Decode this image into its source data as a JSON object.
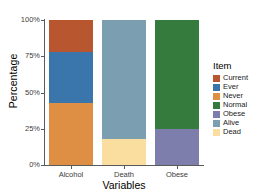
{
  "chart_data": {
    "type": "bar",
    "subtype": "stacked-percent",
    "title": "",
    "xlabel": "Variables",
    "ylabel": "Percentage",
    "categories": [
      "Alcohol",
      "Death",
      "Obese"
    ],
    "ylim": [
      0,
      100
    ],
    "ytick_labels": [
      "0%",
      "25%",
      "50%",
      "75%",
      "100%"
    ],
    "ytick_values": [
      0,
      25,
      50,
      75,
      100
    ],
    "grid": false,
    "legend_title": "Item",
    "legend_position": "right",
    "series": [
      {
        "name": "Current",
        "color": "#b8562f",
        "values": [
          22,
          0,
          0
        ]
      },
      {
        "name": "Ever",
        "color": "#3a76ab",
        "values": [
          35,
          0,
          0
        ]
      },
      {
        "name": "Never",
        "color": "#df8f44",
        "values": [
          43,
          0,
          0
        ]
      },
      {
        "name": "Normal",
        "color": "#357b3e",
        "values": [
          0,
          0,
          75
        ]
      },
      {
        "name": "Obese",
        "color": "#7d7eab",
        "values": [
          0,
          0,
          25
        ]
      },
      {
        "name": "Alive",
        "color": "#7b9fb0",
        "values": [
          0,
          82,
          0
        ]
      },
      {
        "name": "Dead",
        "color": "#fade9f",
        "values": [
          0,
          18,
          0
        ]
      }
    ],
    "bars": [
      {
        "category": "Alcohol",
        "segments": [
          {
            "label": "Current",
            "value": 22,
            "color": "#b8562f"
          },
          {
            "label": "Ever",
            "value": 35,
            "color": "#3a76ab"
          },
          {
            "label": "Never",
            "value": 43,
            "color": "#df8f44"
          }
        ]
      },
      {
        "category": "Death",
        "segments": [
          {
            "label": "Alive",
            "value": 82,
            "color": "#7b9fb0"
          },
          {
            "label": "Dead",
            "value": 18,
            "color": "#fade9f"
          }
        ]
      },
      {
        "category": "Obese",
        "segments": [
          {
            "label": "Normal",
            "value": 75,
            "color": "#357b3e"
          },
          {
            "label": "Obese",
            "value": 25,
            "color": "#7d7eab"
          }
        ]
      }
    ]
  },
  "axes": {
    "y_title": "Percentage",
    "x_title": "Variables",
    "y_ticks": [
      "100%",
      "75%",
      "50%",
      "25%",
      "0%"
    ],
    "x_ticks": [
      "Alcohol",
      "Death",
      "Obese"
    ]
  },
  "legend": {
    "title": "Item",
    "items": [
      {
        "label": "Current",
        "color": "#b8562f"
      },
      {
        "label": "Ever",
        "color": "#3a76ab"
      },
      {
        "label": "Never",
        "color": "#df8f44"
      },
      {
        "label": "Normal",
        "color": "#357b3e"
      },
      {
        "label": "Obese",
        "color": "#7d7eab"
      },
      {
        "label": "Alive",
        "color": "#7b9fb0"
      },
      {
        "label": "Dead",
        "color": "#fade9f"
      }
    ]
  },
  "colors": {
    "axis": "#5a5a5a",
    "tick_text": "#3d3d3d",
    "title_text": "#000000",
    "background": "#ffffff"
  }
}
